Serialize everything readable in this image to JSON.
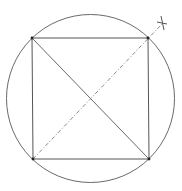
{
  "diagram": {
    "colors": {
      "background": "#ffffff",
      "circle": "#6a6a6a",
      "square": "#555555",
      "diagonal_solid": "#6a6a6a",
      "diagonal_dashed": "#8a8a8a",
      "vertex": "#222222",
      "marker": "#555555"
    },
    "circle": {
      "cx": 90.5,
      "cy": 98.5,
      "r": 84
    },
    "square": {
      "vertices": [
        {
          "name": "top-left",
          "x": 32,
          "y": 38
        },
        {
          "name": "top-right",
          "x": 148,
          "y": 38
        },
        {
          "name": "bottom-right",
          "x": 149,
          "y": 159
        },
        {
          "name": "bottom-left",
          "x": 33,
          "y": 159
        }
      ]
    },
    "diagonal_solid": {
      "x1": 32,
      "y1": 38,
      "x2": 149,
      "y2": 159
    },
    "diagonal_dashed": {
      "x1": 33,
      "y1": 159,
      "x2": 162,
      "y2": 24
    },
    "marker": {
      "type": "cross",
      "x": 162,
      "y": 23
    }
  }
}
